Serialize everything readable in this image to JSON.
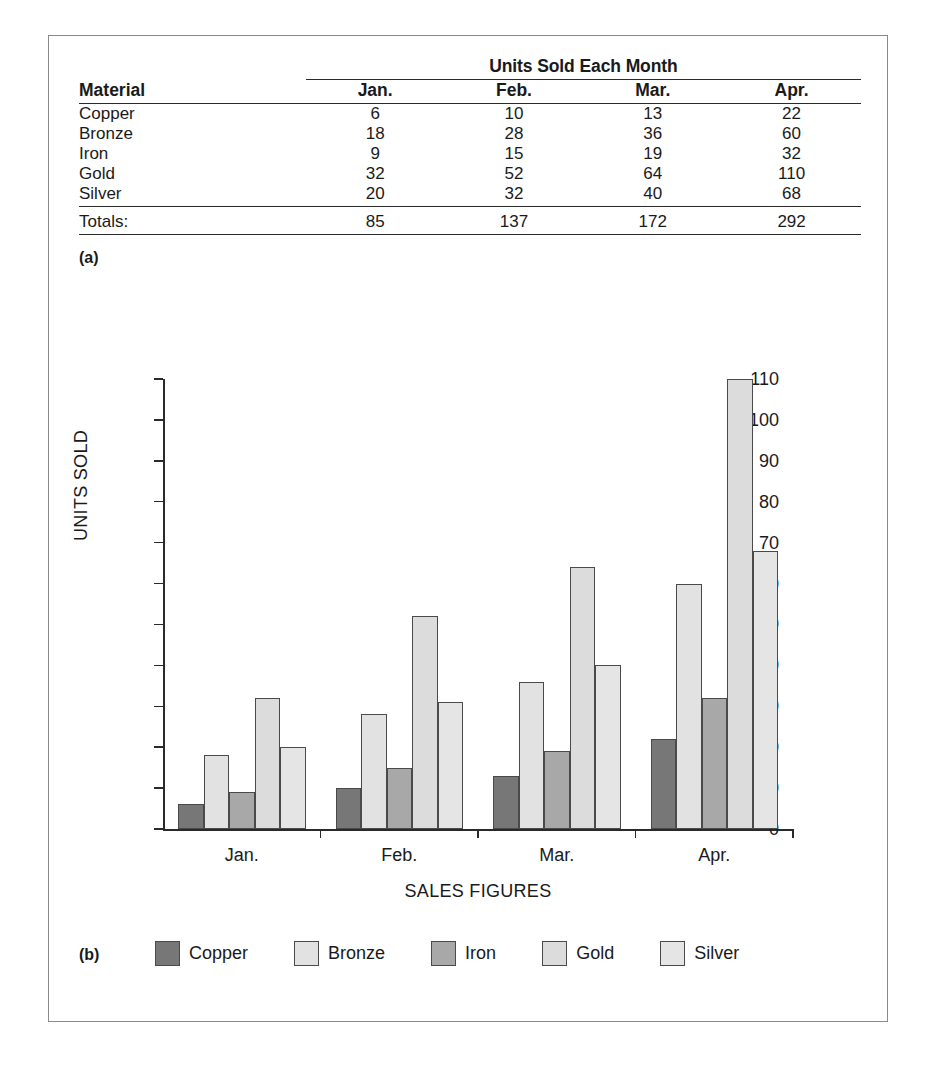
{
  "figure": {
    "panel_a_label": "(a)",
    "panel_b_label": "(b)"
  },
  "table": {
    "spanner": "Units Sold Each Month",
    "material_header": "Material",
    "month_headers": [
      "Jan.",
      "Feb.",
      "Mar.",
      "Apr."
    ],
    "rows": [
      {
        "material": "Copper",
        "values": [
          "6",
          "10",
          "13",
          "22"
        ]
      },
      {
        "material": "Bronze",
        "values": [
          "18",
          "28",
          "36",
          "60"
        ]
      },
      {
        "material": "Iron",
        "values": [
          "9",
          "15",
          "19",
          "32"
        ]
      },
      {
        "material": "Gold",
        "values": [
          "32",
          "52",
          "64",
          "110"
        ]
      },
      {
        "material": "Silver",
        "values": [
          "20",
          "32",
          "40",
          "68"
        ]
      }
    ],
    "totals_label": "Totals:",
    "totals": [
      "85",
      "137",
      "172",
      "292"
    ]
  },
  "chart_data": {
    "type": "bar",
    "title": "",
    "xlabel": "SALES FIGURES",
    "ylabel": "UNITS SOLD",
    "categories": [
      "Jan.",
      "Feb.",
      "Mar.",
      "Apr."
    ],
    "ylim": [
      0,
      110
    ],
    "yticks": [
      0,
      10,
      20,
      30,
      40,
      50,
      60,
      70,
      80,
      90,
      100,
      110
    ],
    "grid": false,
    "legend_position": "bottom",
    "series": [
      {
        "name": "Copper",
        "color": "#777777",
        "values": [
          6,
          10,
          13,
          22
        ]
      },
      {
        "name": "Bronze",
        "color": "#e2e2e2",
        "values": [
          18,
          28,
          36,
          60
        ]
      },
      {
        "name": "Iron",
        "color": "#a8a8a8",
        "values": [
          9,
          15,
          19,
          32
        ]
      },
      {
        "name": "Gold",
        "color": "#dcdcdc",
        "values": [
          32,
          52,
          64,
          110
        ]
      },
      {
        "name": "Silver",
        "color": "#e5e5e5",
        "values": [
          20,
          31,
          40,
          68
        ]
      }
    ]
  }
}
